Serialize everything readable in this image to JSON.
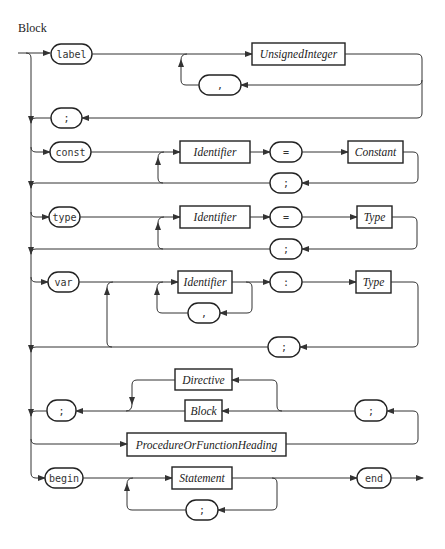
{
  "title": "Block",
  "terminals": {
    "label": "label",
    "comma1": ",",
    "semi_label": ";",
    "const": "const",
    "eq_const": "=",
    "semi_const": ";",
    "type": "type",
    "eq_type": "=",
    "semi_type": ";",
    "var": "var",
    "colon_var": ":",
    "comma_var": ",",
    "semi_var": ";",
    "semi_proc_left": ";",
    "semi_proc_right": ";",
    "begin": "begin",
    "semi_stmt": ";",
    "end": "end"
  },
  "nonterminals": {
    "unsigned_integer": "UnsignedInteger",
    "const_identifier": "Identifier",
    "constant": "Constant",
    "type_identifier": "Identifier",
    "type_type": "Type",
    "var_identifier": "Identifier",
    "var_type": "Type",
    "directive": "Directive",
    "block": "Block",
    "proc_heading": "ProcedureOrFunctionHeading",
    "statement": "Statement"
  }
}
